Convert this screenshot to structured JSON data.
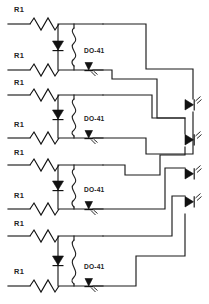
{
  "diagram": {
    "type": "electronic-schematic",
    "width": 209,
    "height": 304,
    "background_color": "#ffffff",
    "line_color": "#1b1b1b",
    "text_color": "#242424"
  },
  "labels": {
    "resistor": "R1",
    "package": "DO-41"
  },
  "cells": [
    {
      "index": 1,
      "top_resistor_label": "R1",
      "bottom_resistor_label": "R1",
      "package_label": "DO-41",
      "top_rail_y": 24,
      "bottom_rail_y": 70,
      "diode_name": "rectifier-diode",
      "coil_name": "vertical-resistor-squiggle",
      "led_name": "signal-led"
    },
    {
      "index": 2,
      "top_resistor_label": "R1",
      "bottom_resistor_label": "R1",
      "package_label": "DO-41",
      "top_rail_y": 95,
      "bottom_rail_y": 138,
      "diode_name": "rectifier-diode",
      "coil_name": "vertical-resistor-squiggle",
      "led_name": "signal-led"
    },
    {
      "index": 3,
      "top_resistor_label": "R1",
      "bottom_resistor_label": "R1",
      "package_label": "DO-41",
      "top_rail_y": 165,
      "bottom_rail_y": 209,
      "diode_name": "rectifier-diode",
      "coil_name": "vertical-resistor-squiggle",
      "led_name": "signal-led"
    },
    {
      "index": 4,
      "top_resistor_label": "R1",
      "bottom_resistor_label": "R1",
      "package_label": "DO-41",
      "top_rail_y": 236,
      "bottom_rail_y": 286,
      "diode_name": "rectifier-diode",
      "coil_name": "vertical-resistor-squiggle",
      "led_name": "signal-led"
    }
  ],
  "output_leds": [
    {
      "index": 1,
      "name": "output-led-1",
      "y": 104
    },
    {
      "index": 2,
      "name": "output-led-2",
      "y": 139
    },
    {
      "index": 3,
      "name": "output-led-3",
      "y": 173
    },
    {
      "index": 4,
      "name": "output-led-4",
      "y": 208
    }
  ],
  "resistor_labels": [
    {
      "id": "r1-1",
      "text": "R1",
      "x": 14,
      "y": 12
    },
    {
      "id": "r1-2",
      "text": "R1",
      "x": 14,
      "y": 58
    },
    {
      "id": "r1-3",
      "text": "R1",
      "x": 14,
      "y": 82
    },
    {
      "id": "r1-4",
      "text": "R1",
      "x": 14,
      "y": 127
    },
    {
      "id": "r1-5",
      "text": "R1",
      "x": 14,
      "y": 152
    },
    {
      "id": "r1-6",
      "text": "R1",
      "x": 14,
      "y": 198
    },
    {
      "id": "r1-7",
      "text": "R1",
      "x": 14,
      "y": 223
    },
    {
      "id": "r1-8",
      "text": "R1",
      "x": 14,
      "y": 274
    }
  ],
  "package_labels": [
    {
      "id": "do41-1",
      "text": "DO-41",
      "x": 84,
      "y": 53
    },
    {
      "id": "do41-2",
      "text": "DO-41",
      "x": 84,
      "y": 121
    },
    {
      "id": "do41-3",
      "text": "DO-41",
      "x": 84,
      "y": 192
    },
    {
      "id": "do41-4",
      "text": "DO-41",
      "x": 84,
      "y": 269
    }
  ]
}
